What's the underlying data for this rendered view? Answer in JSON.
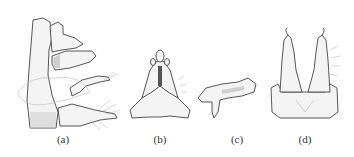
{
  "figure": {
    "panels": [
      {
        "id": "a",
        "label": "(a)",
        "subject": "lateral view of genital segment",
        "label_x": 63
      },
      {
        "id": "b",
        "label": "(b)",
        "subject": "ventral plate with paired lobes",
        "label_x": 160
      },
      {
        "id": "c",
        "label": "(c)",
        "subject": "isolated sclerite",
        "label_x": 237
      },
      {
        "id": "d",
        "label": "(d)",
        "subject": "dorsal view of claspers on ring segment",
        "label_x": 305
      }
    ],
    "style": "black ink line drawing with stippled shading on white background"
  }
}
